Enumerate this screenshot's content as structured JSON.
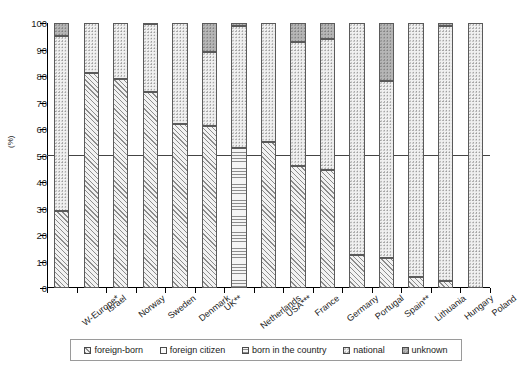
{
  "chart_data": {
    "type": "bar",
    "subtype": "stacked-bar-100",
    "title": "",
    "xlabel": "",
    "ylabel": "(%)",
    "ylim": [
      0,
      100
    ],
    "yticks": [
      0,
      10,
      20,
      30,
      40,
      50,
      60,
      70,
      80,
      90,
      100
    ],
    "grid": false,
    "reference_line": 50,
    "legend_position": "bottom",
    "categories": [
      "W-Europe*",
      "Israel",
      "Norway",
      "Sweden",
      "Denmark",
      "UK**",
      "Netherlands",
      "USA***",
      "France",
      "Germany",
      "Portugal",
      "Spain**",
      "Lithuania",
      "Hungary",
      "Poland"
    ],
    "series": [
      {
        "name": "foreign-born",
        "pattern": "diagonal-hatch",
        "values": [
          29,
          81,
          79,
          74,
          62,
          61,
          0,
          55,
          46,
          44.5,
          12.5,
          11.5,
          4,
          2.5,
          0
        ]
      },
      {
        "name": "foreign citizen",
        "pattern": "blank",
        "values": [
          0,
          0,
          0,
          0,
          0,
          0,
          0,
          0,
          0,
          0,
          0,
          0,
          0,
          0,
          0
        ]
      },
      {
        "name": "born in the country",
        "pattern": "horizontal-lines",
        "values": [
          0,
          0,
          0,
          0,
          0,
          0,
          53,
          0,
          0,
          0,
          0,
          0,
          0,
          0,
          0
        ]
      },
      {
        "name": "national",
        "pattern": "dotted",
        "values": [
          66,
          19,
          21,
          25.5,
          38,
          28,
          46,
          45,
          47,
          49.5,
          87.5,
          66.5,
          96,
          96.5,
          100
        ]
      },
      {
        "name": "unknown",
        "pattern": "dark-dotted",
        "values": [
          5,
          0,
          0,
          0.5,
          0,
          11,
          1,
          0,
          7,
          6,
          0,
          22,
          0,
          1,
          0
        ]
      }
    ],
    "legend": [
      "foreign-born",
      "foreign citizen",
      "born in the country",
      "national",
      "unknown"
    ]
  }
}
